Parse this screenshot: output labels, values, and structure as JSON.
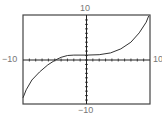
{
  "chart_data": {
    "type": "line",
    "title": "",
    "xlabel": "",
    "ylabel": "",
    "xlim": [
      -10,
      10
    ],
    "ylim": [
      -10,
      10
    ],
    "tick_spacing": 1,
    "grid": false,
    "labels": {
      "top": "10",
      "bottom": "−10",
      "left": "−10",
      "right": "10"
    },
    "series": [
      {
        "name": "f(x)",
        "x": [
          -10,
          -9.5,
          -8.6,
          -7.4,
          -6.1,
          -4.9,
          -4,
          -3,
          -2,
          0,
          2,
          3.8,
          5.4,
          7,
          8.3,
          9.4,
          9.8
        ],
        "y": [
          -8.5,
          -6.7,
          -4.5,
          -2.7,
          -1.1,
          0,
          0.6,
          1.0,
          1.1,
          1.1,
          1.2,
          1.6,
          2.5,
          4.0,
          6.1,
          8.5,
          9.9
        ]
      }
    ]
  }
}
